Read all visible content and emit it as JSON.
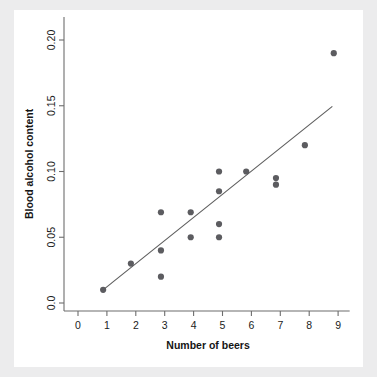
{
  "figure": {
    "background_color": "#ececed",
    "panel_color": "#ffffff"
  },
  "chart_data": {
    "type": "scatter",
    "title": "",
    "xlabel": "Number of beers",
    "ylabel": "Blood alcohol content",
    "xlim": [
      -0.35,
      9.4
    ],
    "ylim": [
      -0.008,
      0.213
    ],
    "grid": false,
    "legend": null,
    "x_ticks": [
      0,
      1,
      2,
      3,
      4,
      5,
      6,
      7,
      8,
      9
    ],
    "x_tick_labels": [
      "0",
      "1",
      "2",
      "3",
      "4",
      "5",
      "6",
      "7",
      "8",
      "9"
    ],
    "y_ticks": [
      0.0,
      0.05,
      0.1,
      0.15,
      0.2
    ],
    "y_tick_labels": [
      "0.0",
      "0.05",
      "0.10",
      "0.15",
      "0.20"
    ],
    "point_color": "#5c5c60",
    "point_size": 3.1,
    "x": [
      0.87,
      1.83,
      2.87,
      2.87,
      2.87,
      3.9,
      3.9,
      4.88,
      4.88,
      4.88,
      4.88,
      5.82,
      6.85,
      6.85,
      7.85,
      8.85
    ],
    "y": [
      0.01,
      0.03,
      0.069,
      0.04,
      0.02,
      0.069,
      0.05,
      0.1,
      0.085,
      0.06,
      0.05,
      0.1,
      0.095,
      0.09,
      0.12,
      0.19
    ],
    "series": [
      {
        "name": "observations",
        "points": [
          {
            "x": 0.87,
            "y": 0.01
          },
          {
            "x": 1.83,
            "y": 0.03
          },
          {
            "x": 2.87,
            "y": 0.069
          },
          {
            "x": 2.87,
            "y": 0.04
          },
          {
            "x": 2.87,
            "y": 0.02
          },
          {
            "x": 3.9,
            "y": 0.069
          },
          {
            "x": 3.9,
            "y": 0.05
          },
          {
            "x": 4.88,
            "y": 0.1
          },
          {
            "x": 4.88,
            "y": 0.085
          },
          {
            "x": 4.88,
            "y": 0.06
          },
          {
            "x": 4.88,
            "y": 0.05
          },
          {
            "x": 5.82,
            "y": 0.1
          },
          {
            "x": 6.85,
            "y": 0.095
          },
          {
            "x": 6.85,
            "y": 0.09
          },
          {
            "x": 7.85,
            "y": 0.12
          },
          {
            "x": 8.85,
            "y": 0.19
          }
        ]
      }
    ],
    "fit_line": {
      "name": "least-squares regression line",
      "color": "#5d5d5d",
      "x_start": 0.9,
      "y_start": 0.0105,
      "x_end": 8.8,
      "y_end": 0.1495
    },
    "annotations": []
  }
}
